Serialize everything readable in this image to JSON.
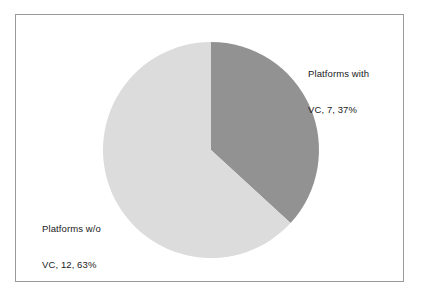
{
  "chart_data": {
    "type": "pie",
    "title": "",
    "subtitle": "",
    "xlabel": "",
    "ylabel": "",
    "grid": false,
    "legend_position": "none",
    "start_angle_deg": 0,
    "direction": "clockwise",
    "center": {
      "x": 211,
      "y": 150
    },
    "radius": 108,
    "total": 19,
    "categories": [
      "Platforms with VC",
      "Platforms w/o VC"
    ],
    "values": [
      7,
      12
    ],
    "percentages": [
      37,
      63
    ],
    "colors": [
      "#929292",
      "#dcdcdc"
    ],
    "slices": [
      {
        "name": "Platforms with VC",
        "value": 7,
        "percent": 37,
        "color": "#929292",
        "start_deg": 0,
        "end_deg": 132.6,
        "label_line1": "Platforms with",
        "label_line2": "VC, 7, 37%",
        "label_position": "right"
      },
      {
        "name": "Platforms w/o VC",
        "value": 12,
        "percent": 63,
        "color": "#dcdcdc",
        "start_deg": 132.6,
        "end_deg": 360,
        "label_line1": "Platforms w/o",
        "label_line2": "VC, 12, 63%",
        "label_position": "left"
      }
    ]
  },
  "frame": {
    "border_color": "#9a9a9a",
    "background": "#ffffff"
  },
  "labels": {
    "with_vc": {
      "line1": "Platforms with",
      "line2": "VC, 7, 37%"
    },
    "without_vc": {
      "line1": "Platforms w/o",
      "line2": "VC, 12, 63%"
    }
  }
}
